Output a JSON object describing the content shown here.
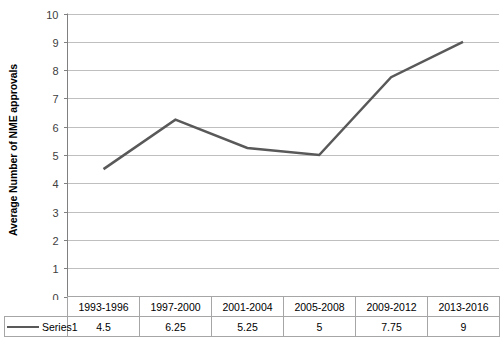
{
  "chart_data": {
    "type": "line",
    "title": "",
    "xlabel": "",
    "ylabel": "Average Number of NME approvals",
    "categories": [
      "1993-1996",
      "1997-2000",
      "2001-2004",
      "2005-2008",
      "2009-2012",
      "2013-2016"
    ],
    "series": [
      {
        "name": "Series1",
        "values": [
          4.5,
          6.25,
          5.25,
          5,
          7.75,
          9
        ],
        "value_labels": [
          "4.5",
          "6.25",
          "5.25",
          "5",
          "7.75",
          "9"
        ],
        "color": "#595959"
      }
    ],
    "ylim": [
      0,
      10
    ],
    "ytick_labels": [
      "10",
      "9",
      "8",
      "7",
      "6",
      "5",
      "4",
      "3",
      "2",
      "1",
      "0"
    ],
    "ytick_values": [
      10,
      9,
      8,
      7,
      6,
      5,
      4,
      3,
      2,
      1,
      0
    ],
    "grid": true,
    "legend_position": "data-table",
    "show_data_table": true,
    "markers": false,
    "colors": {
      "gridline": "#bfbfbf",
      "axis": "#808080",
      "series": "#595959",
      "table_border": "#a6a6a6",
      "background": "#ffffff",
      "tick_label": "#404040"
    }
  },
  "data_table": {
    "legend_label": "Series1",
    "header_cells": [
      "1993-1996",
      "1997-2000",
      "2001-2004",
      "2005-2008",
      "2009-2012",
      "2013-2016"
    ],
    "value_cells": [
      "4.5",
      "6.25",
      "5.25",
      "5",
      "7.75",
      "9"
    ]
  }
}
